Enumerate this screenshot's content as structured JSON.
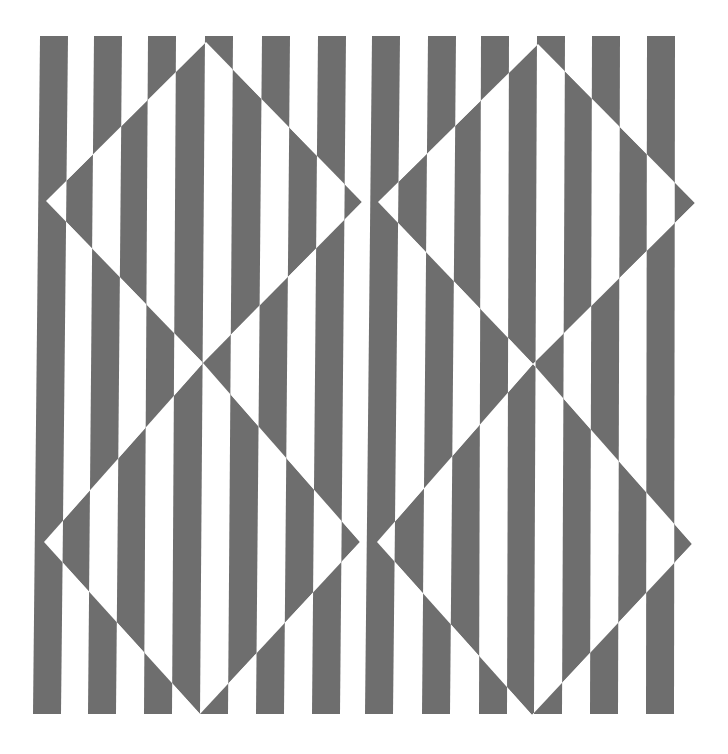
{
  "artwork": {
    "type": "op-art stripe pattern with inverted diamonds",
    "canvas": {
      "width": 728,
      "height": 754,
      "background": "#ffffff"
    },
    "stripe_color": "#6e6e6e",
    "stripes": {
      "count": 12,
      "top_y": 36,
      "bottom_y": 714,
      "width": 28,
      "top_left_edges": [
        40,
        94,
        148,
        205,
        262,
        318,
        372,
        428,
        481,
        537,
        592,
        647
      ],
      "bottom_left_edges": [
        33,
        88,
        144,
        200,
        256,
        312,
        365,
        422,
        479,
        534,
        590,
        646
      ]
    },
    "diamonds": [
      {
        "name": "top-left",
        "points": [
          [
            206,
            42
          ],
          [
            362,
            202
          ],
          [
            203,
            363
          ],
          [
            46,
            201
          ]
        ]
      },
      {
        "name": "top-right",
        "points": [
          [
            538,
            44
          ],
          [
            695,
            203
          ],
          [
            533,
            364
          ],
          [
            378,
            202
          ]
        ]
      },
      {
        "name": "bottom-left",
        "points": [
          [
            203,
            363
          ],
          [
            360,
            542
          ],
          [
            200,
            714
          ],
          [
            44,
            542
          ]
        ]
      },
      {
        "name": "bottom-right",
        "points": [
          [
            533,
            364
          ],
          [
            692,
            544
          ],
          [
            532,
            715
          ],
          [
            377,
            542
          ]
        ]
      }
    ]
  }
}
